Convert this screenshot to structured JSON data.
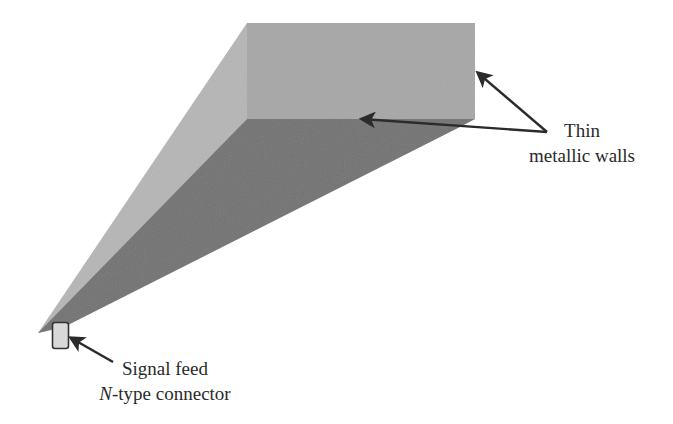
{
  "diagram": {
    "type": "horn-antenna-3d-illustration",
    "colors": {
      "front_face": "#a7a7a7",
      "left_face": "#b6b6b6",
      "bottom_face": "#727272",
      "connector_fill": "#d8d8d8",
      "connector_stroke": "#333333",
      "arrow": "#2b2b2b",
      "text": "#2a2a2a",
      "background": "#ffffff"
    },
    "labels": {
      "walls": {
        "line1": "Thin",
        "line2": "metallic walls"
      },
      "feed": {
        "line1": "Signal feed",
        "line2_italic": "N",
        "line2_rest": "-type connector"
      }
    }
  }
}
